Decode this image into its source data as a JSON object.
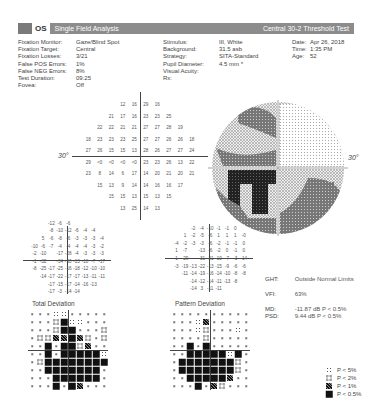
{
  "header": {
    "eye": "OS",
    "title": "Single Field Analysis",
    "test": "Central 30-2 Threshold Test",
    "bar_color": "#8c8c8c"
  },
  "info_left": [
    {
      "k": "Fixation Monitor:",
      "v": "Gaze/Blind Spot"
    },
    {
      "k": "Fixation Target:",
      "v": "Central"
    },
    {
      "k": "Fixation Losses:",
      "v": "3/21"
    },
    {
      "k": "False POS Errors:",
      "v": "1%"
    },
    {
      "k": "False NEG Errors:",
      "v": "8%"
    },
    {
      "k": "Test Duration:",
      "v": "09:25"
    },
    {
      "k": "Fovea:",
      "v": "Off"
    }
  ],
  "info_mid": [
    {
      "k": "Stimulus:",
      "v": "III, White"
    },
    {
      "k": "Background:",
      "v": "31.5 asb"
    },
    {
      "k": "Strategy:",
      "v": "SITA-Standard"
    },
    {
      "k": "Pupil Diameter:",
      "v": "4.5 mm *"
    },
    {
      "k": "Visual Acuity:",
      "v": ""
    },
    {
      "k": "Rx:",
      "v": ""
    }
  ],
  "info_right": [
    {
      "k": "Date:",
      "v": "Apr 26, 2018"
    },
    {
      "k": "Time:",
      "v": "1:35 PM"
    },
    {
      "k": "Age:",
      "v": "52"
    }
  ],
  "threshold": {
    "degree_label_left": "30°",
    "degree_label_right": "30°",
    "rows": [
      [
        "",
        "",
        "",
        "12",
        "16",
        "29",
        "16",
        "",
        "",
        ""
      ],
      [
        "",
        "",
        "21",
        "17",
        "16",
        "23",
        "23",
        "25",
        "",
        ""
      ],
      [
        "",
        "22",
        "22",
        "21",
        "21",
        "27",
        "27",
        "28",
        "19",
        ""
      ],
      [
        "18",
        "23",
        "23",
        "23",
        "25",
        "27",
        "27",
        "26",
        "26",
        "18"
      ],
      [
        "27",
        "26",
        "15",
        "15",
        "13",
        "28",
        "26",
        "27",
        "27",
        "24"
      ],
      [
        "29",
        "<0",
        "<0",
        "<0",
        "<0",
        "23",
        "23",
        "26",
        "13",
        "22"
      ],
      [
        "23",
        "8",
        "14",
        "6",
        "17",
        "14",
        "20",
        "21",
        "20",
        "21"
      ],
      [
        "",
        "15",
        "13",
        "9",
        "14",
        "14",
        "16",
        "16",
        "17",
        ""
      ],
      [
        "",
        "",
        "15",
        "15",
        "13",
        "15",
        "13",
        "15",
        "",
        ""
      ],
      [
        "",
        "",
        "",
        "13",
        "25",
        "14",
        "13",
        "",
        "",
        ""
      ]
    ]
  },
  "total_deviation": {
    "caption": "Total Deviation",
    "rows": [
      [
        "",
        "",
        "",
        "-12",
        "-6",
        "-6",
        "",
        "",
        "",
        ""
      ],
      [
        "",
        "",
        "",
        "-8",
        "-10",
        "-12",
        "-6",
        "-4",
        "-4",
        ""
      ],
      [
        "",
        "",
        "5",
        "-6",
        "-8",
        "-6",
        "-3",
        "-3",
        "-3",
        "-4"
      ],
      [
        "",
        "-10",
        "-6",
        "-7",
        "-4",
        "-4",
        "-4",
        "-4",
        "-3",
        "-2"
      ],
      [
        "",
        "-2",
        "-10",
        "",
        "-17",
        "-28",
        "-4",
        "-3",
        "-3",
        "-3"
      ],
      [
        "",
        "-1",
        "-32",
        "",
        "-34",
        "-30",
        "-13",
        "-10",
        "-7",
        "-17"
      ],
      [
        "",
        "-8",
        "-25",
        "-17",
        "-25",
        "-16",
        "-18",
        "-12",
        "-10",
        "-10"
      ],
      [
        "",
        "",
        "-14",
        "-17",
        "-22",
        "-17",
        "-17",
        "-13",
        "-11",
        "-11"
      ],
      [
        "",
        "",
        "",
        "-17",
        "-15",
        "-17",
        "-14",
        "-16",
        "-13",
        ""
      ],
      [
        "",
        "",
        "",
        "-17",
        "-3",
        "-14",
        "-14",
        "",
        "",
        ""
      ]
    ]
  },
  "pattern_deviation": {
    "caption": "Pattern Deviation",
    "rows": [
      [
        "",
        "",
        "",
        "-2",
        "-4",
        "-10",
        "-1",
        "-1",
        "0",
        ""
      ],
      [
        "",
        "",
        "1",
        "-2",
        "-5",
        "-6",
        "1",
        "1",
        "1",
        "-0"
      ],
      [
        "",
        "-4",
        "-2",
        "-3",
        "-3",
        "-6",
        "-2",
        "-1",
        "-1",
        "0"
      ],
      [
        "",
        "1",
        "-7",
        "",
        "-13",
        "-6",
        "-2",
        "0",
        "-1",
        "0"
      ],
      [
        "",
        "1",
        "-29",
        "",
        "-31",
        "-21",
        "-10",
        "-7",
        "-3",
        "-14"
      ],
      [
        "",
        "-3",
        "-19",
        "-13",
        "-22",
        "-13",
        "-15",
        "-9",
        "-6",
        "-6"
      ],
      [
        "",
        "",
        "-11",
        "-14",
        "-19",
        "-16",
        "-14",
        "-10",
        "-8",
        "-8"
      ],
      [
        "",
        "",
        "",
        "-14",
        "-12",
        "-14",
        "-11",
        "-13",
        "-8",
        ""
      ],
      [
        "",
        "",
        "",
        "-14",
        "3",
        "-11",
        "-11",
        "",
        "",
        ""
      ]
    ]
  },
  "stats": {
    "ght_label": "GHT:",
    "ght_value": "Outside Normal Limits",
    "vfi_label": "VFI:",
    "vfi_value": "63%",
    "md_label": "MD:",
    "md_value": "-11.87 dB P < 0.5%",
    "psd_label": "PSD:",
    "psd_value": "9.44 dB P < 0.5%"
  },
  "prob_total": {
    "caption": "Total Deviation",
    "rows": [
      [
        0,
        0,
        0,
        1,
        1,
        0,
        0,
        0,
        0,
        0
      ],
      [
        0,
        0,
        0,
        2,
        4,
        1,
        1,
        0,
        0,
        0
      ],
      [
        0,
        0,
        0,
        2,
        4,
        4,
        0,
        0,
        0,
        2
      ],
      [
        0,
        2,
        2,
        3,
        3,
        4,
        3,
        2,
        0,
        2
      ],
      [
        0,
        0,
        4,
        0,
        4,
        4,
        2,
        3,
        0,
        0
      ],
      [
        0,
        0,
        4,
        0,
        4,
        4,
        4,
        4,
        4,
        1
      ],
      [
        0,
        2,
        4,
        4,
        4,
        4,
        4,
        4,
        4,
        4
      ],
      [
        0,
        0,
        4,
        4,
        4,
        4,
        4,
        4,
        4,
        0
      ],
      [
        0,
        0,
        0,
        4,
        4,
        4,
        4,
        4,
        4,
        0
      ],
      [
        0,
        0,
        0,
        4,
        0,
        4,
        3,
        0,
        0,
        0
      ]
    ]
  },
  "prob_pattern": {
    "caption": "Pattern Deviation",
    "rows": [
      [
        0,
        0,
        0,
        0,
        0,
        0,
        0,
        0,
        0,
        0
      ],
      [
        0,
        0,
        0,
        1,
        3,
        0,
        0,
        0,
        0,
        0
      ],
      [
        0,
        0,
        0,
        1,
        2,
        0,
        0,
        0,
        1,
        0
      ],
      [
        0,
        0,
        0,
        0,
        2,
        0,
        0,
        0,
        0,
        0
      ],
      [
        0,
        0,
        4,
        0,
        4,
        0,
        0,
        0,
        0,
        0
      ],
      [
        0,
        0,
        4,
        4,
        4,
        4,
        4,
        1,
        4,
        0
      ],
      [
        0,
        4,
        4,
        4,
        4,
        4,
        4,
        4,
        2,
        0
      ],
      [
        0,
        4,
        4,
        4,
        4,
        4,
        4,
        4,
        2,
        0
      ],
      [
        0,
        0,
        4,
        4,
        4,
        4,
        4,
        3,
        0,
        0
      ],
      [
        0,
        0,
        0,
        4,
        0,
        3,
        2,
        0,
        0,
        0
      ]
    ]
  },
  "legend": [
    {
      "sym": 1,
      "label": "P < 5%"
    },
    {
      "sym": 2,
      "label": "P < 2%"
    },
    {
      "sym": 3,
      "label": "P < 1%"
    },
    {
      "sym": 4,
      "label": "P < 0.5%"
    }
  ]
}
